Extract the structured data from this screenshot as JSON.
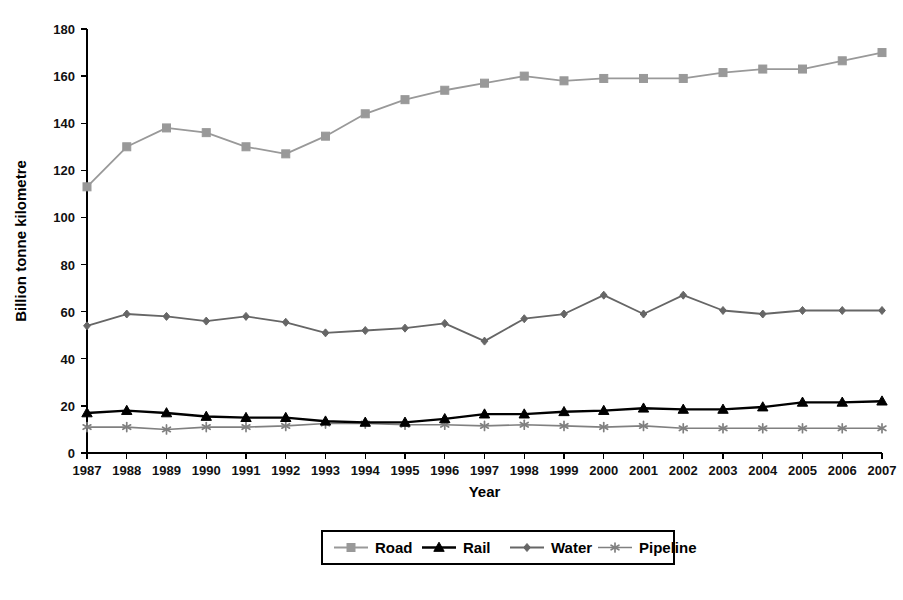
{
  "chart_data": {
    "type": "line",
    "title": "",
    "xlabel": "Year",
    "ylabel": "Billion tonne kilometre",
    "grid": false,
    "legend_position": "bottom",
    "xlim": [
      1987,
      2007
    ],
    "ylim": [
      0,
      180
    ],
    "ytick_step": 20,
    "yticks": [
      0,
      20,
      40,
      60,
      80,
      100,
      120,
      140,
      160,
      180
    ],
    "ytick_labels": [
      "0",
      "20",
      "40",
      "60",
      "80",
      "100",
      "120",
      "140",
      "160",
      "180"
    ],
    "categories": [
      1987,
      1988,
      1989,
      1990,
      1991,
      1992,
      1993,
      1994,
      1995,
      1996,
      1997,
      1998,
      1999,
      2000,
      2001,
      2002,
      2003,
      2004,
      2005,
      2006,
      2007
    ],
    "xtick_labels": [
      "1987",
      "1988",
      "1989",
      "1990",
      "1991",
      "1992",
      "1993",
      "1994",
      "1995",
      "1996",
      "1997",
      "1998",
      "1999",
      "2000",
      "2001",
      "2002",
      "2003",
      "2004",
      "2005",
      "2006",
      "2007"
    ],
    "series": [
      {
        "name": "Road",
        "marker": "square",
        "color": "#999999",
        "line_color": "#999999",
        "line_width": 1.8,
        "marker_size": 8,
        "values": [
          113,
          130,
          138,
          136,
          130,
          127,
          134.5,
          144,
          150,
          154,
          157,
          160,
          158,
          159,
          159,
          159,
          161.5,
          163,
          163,
          166.5,
          170
        ]
      },
      {
        "name": "Rail",
        "marker": "triangle",
        "color": "#000000",
        "line_color": "#000000",
        "line_width": 2.4,
        "marker_size": 9,
        "values": [
          17,
          18,
          17,
          15.5,
          15,
          15,
          13.5,
          13,
          13,
          14.5,
          16.5,
          16.5,
          17.5,
          18,
          19,
          18.5,
          18.5,
          19.5,
          21.5,
          21.5,
          22
        ]
      },
      {
        "name": "Water",
        "marker": "diamond",
        "color": "#666666",
        "line_color": "#666666",
        "line_width": 1.8,
        "marker_size": 8,
        "values": [
          54,
          59,
          58,
          56,
          58,
          55.5,
          51,
          52,
          53,
          55,
          47.5,
          57,
          59,
          67,
          59,
          67,
          60.5,
          59,
          60.5,
          60.5,
          60.5
        ]
      },
      {
        "name": "Pipeline",
        "marker": "asterisk",
        "color": "#808080",
        "line_color": "#808080",
        "line_width": 1.6,
        "marker_size": 9,
        "values": [
          11,
          11,
          10,
          11,
          11,
          11.5,
          12.5,
          12.5,
          12,
          12,
          11.5,
          12,
          11.5,
          11,
          11.5,
          10.5,
          10.5,
          10.5,
          10.5,
          10.5,
          10.5
        ]
      }
    ]
  },
  "legend": {
    "entries": [
      {
        "label": "Road"
      },
      {
        "label": "Rail"
      },
      {
        "label": "Water"
      },
      {
        "label": "Pipeline"
      }
    ]
  }
}
